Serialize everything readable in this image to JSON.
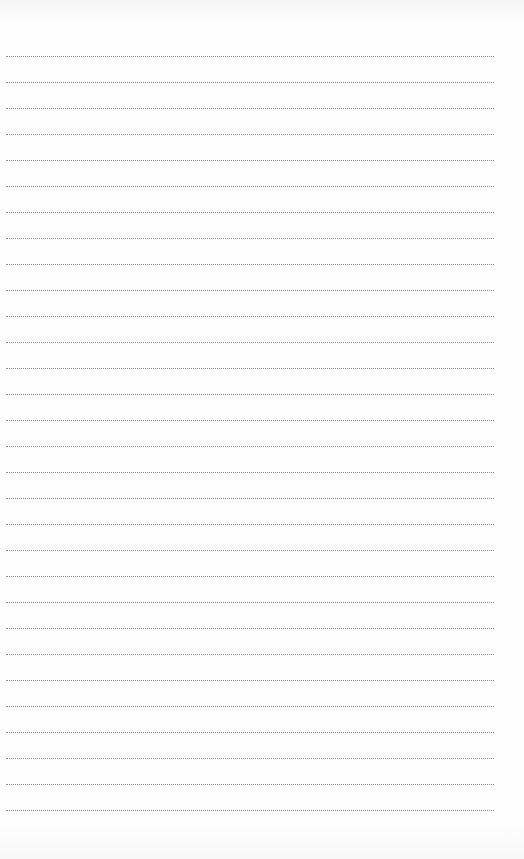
{
  "document": {
    "type": "lined-writing-page",
    "line_count": 30,
    "first_line_y": 56,
    "line_spacing": 26,
    "line_left": 6,
    "line_width": 488,
    "line_style": "dotted",
    "line_color": "#8a8a8a",
    "background_color": "#fefefe"
  }
}
